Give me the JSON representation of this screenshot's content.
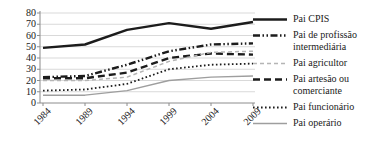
{
  "chart_data": {
    "type": "line",
    "title": "",
    "xlabel": "",
    "ylabel": "",
    "categories": [
      "1984",
      "1989",
      "1994",
      "1999",
      "2004",
      "2009"
    ],
    "y_ticks": [
      0,
      10,
      20,
      30,
      40,
      50,
      60,
      70,
      80
    ],
    "ylim": [
      0,
      80
    ],
    "grid": true,
    "legend_position": "right",
    "series": [
      {
        "id": "pai-cpis",
        "name": "Pai CPIS",
        "values": [
          49,
          52,
          65,
          71,
          66,
          72
        ],
        "color": "#1c1c1c",
        "line_style": "solid",
        "width": 2.4
      },
      {
        "id": "pai-profissao-intermediaria",
        "name": "Pai de profissão intermediária",
        "values": [
          23,
          24,
          34,
          46,
          52,
          53
        ],
        "color": "#1c1c1c",
        "line_style": "dash-dot-dot",
        "width": 2.4
      },
      {
        "id": "pai-agricultor",
        "name": "Pai agricultor",
        "values": [
          20,
          20,
          23,
          37,
          45,
          46
        ],
        "color": "#b5b5b5",
        "line_style": "short-dash",
        "width": 1.5
      },
      {
        "id": "pai-artesao-comerciante",
        "name": "Pai artesão ou comerciante",
        "values": [
          22,
          22,
          27,
          40,
          44,
          43
        ],
        "color": "#1c1c1c",
        "line_style": "long-dash",
        "width": 2.4
      },
      {
        "id": "pai-funcionario",
        "name": "Pai funcionário",
        "values": [
          11,
          12,
          17,
          30,
          34,
          35
        ],
        "color": "#1c1c1c",
        "line_style": "dot",
        "width": 1.8
      },
      {
        "id": "pai-operario",
        "name": "Pai operário",
        "values": [
          7,
          7,
          11,
          20,
          23,
          24
        ],
        "color": "#9e9e9e",
        "line_style": "solid",
        "width": 1.5
      }
    ]
  },
  "colors": {
    "grid": "#d9d9d9",
    "axis": "#8c8c8c",
    "text": "#1a1a1a",
    "background": "#ffffff"
  }
}
